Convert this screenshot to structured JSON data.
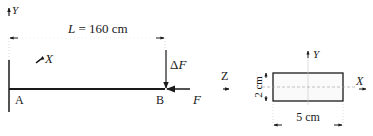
{
  "beam": {
    "length_label": "L = 160 cm",
    "point_a": "A",
    "point_b": "B",
    "force_increment": "ΔF",
    "axial_force": "F",
    "axis_y": "Y",
    "axis_x": "X",
    "axis_z": "Z"
  },
  "cross_section": {
    "axis_y": "Y",
    "axis_x": "X",
    "width_label": "5 cm",
    "height_label": "2 cm"
  },
  "colors": {
    "ink": "#1a1a1a",
    "dash": "#9a9a9a"
  }
}
